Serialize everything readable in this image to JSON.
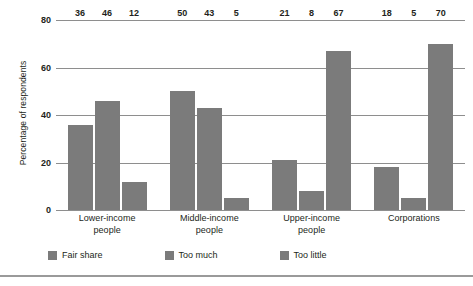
{
  "chart_data": {
    "type": "bar",
    "title": "",
    "subtitle": "",
    "xlabel": "",
    "ylabel": "Percentage of respondents",
    "ylim": [
      0,
      80
    ],
    "yticks": [
      0,
      20,
      40,
      60,
      80
    ],
    "ytick_labels": [
      "0",
      "20",
      "40",
      "60",
      "80"
    ],
    "grid": true,
    "legend_position": "bottom",
    "bar_color": "#7b7b7b",
    "gridline_color": "#8e8e8e",
    "text_color": "#231f20",
    "categories": [
      "Lower-income people",
      "Middle-income people",
      "Upper-income people",
      "Corporations"
    ],
    "category_lines": [
      [
        "Lower-income",
        "people"
      ],
      [
        "Middle-income",
        "people"
      ],
      [
        "Upper-income",
        "people"
      ],
      [
        "Corporations",
        ""
      ]
    ],
    "series": [
      {
        "name": "Fair share",
        "values": [
          36,
          50,
          21,
          18
        ]
      },
      {
        "name": "Too much",
        "values": [
          46,
          43,
          8,
          5
        ]
      },
      {
        "name": "Too little",
        "values": [
          12,
          5,
          67,
          70
        ]
      }
    ]
  },
  "legend": {
    "items": [
      {
        "label": "Fair share"
      },
      {
        "label": "Too much"
      },
      {
        "label": "Too little"
      }
    ]
  }
}
